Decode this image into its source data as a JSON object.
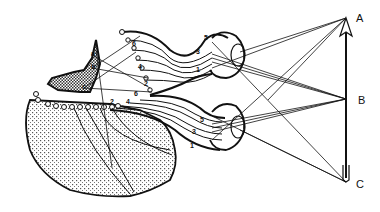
{
  "diagram": {
    "object_points": [
      {
        "label": "A",
        "x": 346,
        "y": 18
      },
      {
        "label": "B",
        "x": 346,
        "y": 99
      },
      {
        "label": "C",
        "x": 346,
        "y": 182
      }
    ],
    "cortex_labels": [
      "a",
      "b",
      "c"
    ],
    "upper_fiber_labels": [
      "6",
      "4",
      "2",
      "5",
      "3",
      "1"
    ],
    "lower_fiber_labels": [
      "6",
      "4",
      "2",
      "5",
      "3",
      "1"
    ],
    "colors": {
      "ink": "#111111",
      "background": "#ffffff",
      "stipple": "#555555"
    }
  }
}
